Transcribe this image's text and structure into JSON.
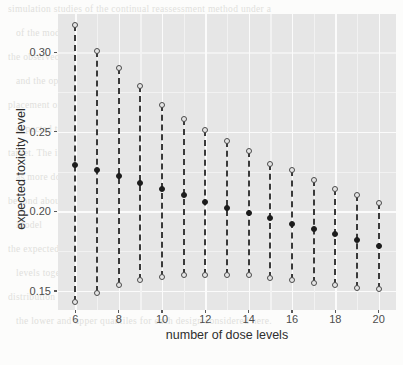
{
  "figure": {
    "background_color": "#fcfcfb",
    "panel_color": "#e6e6e6",
    "gridline_color": "#fbfbfb",
    "point_color": "#1c1c1c",
    "line_color": "#3a3a3a"
  },
  "background_text": {
    "note": "faint scanned body text visible behind the figure",
    "lines": [
      "simulation studies of the continual reassessment method under a",
      "of the model parameters is then maintained by the prior distribution.",
      "the observed data, a key feature is that the number of dose levels",
      "and the operating characteristics are not overly sensitive to the",
      "placement of the dose levels. As the number of doses increases the",
      "expected toxicity level at the recommended dose tends toward the",
      "target. The interval between the upper and lower quantiles narrows",
      "as more dose levels are included, although the gain diminishes",
      "beyond about fifteen levels in these simulations.",
      "Model",
      "the expected toxicity level is plotted against the number of dose",
      "levels together with the tenth and ninetieth percentiles of the",
      "distribution of the recommended dose. The dashed segments join",
      "the lower and upper quantiles for each design considered here."
    ]
  },
  "chart_data": {
    "type": "scatter",
    "title": "",
    "xlabel": "number of dose levels",
    "ylabel": "expected toxicity level",
    "xlim": [
      5.2,
      20.8
    ],
    "ylim": [
      0.138,
      0.324
    ],
    "xticks": [
      6,
      8,
      10,
      12,
      14,
      16,
      18,
      20
    ],
    "xtick_labels": [
      "6",
      "8",
      "10",
      "12",
      "14",
      "16",
      "18",
      "20"
    ],
    "yticks": [
      0.15,
      0.2,
      0.25,
      0.3
    ],
    "ytick_labels": [
      "0.15",
      "0.20",
      "0.25",
      "0.30"
    ],
    "grid": true,
    "legend": "none",
    "x": [
      6,
      7,
      8,
      9,
      10,
      11,
      12,
      13,
      14,
      15,
      16,
      17,
      18,
      19,
      20
    ],
    "series": [
      {
        "name": "upper quantile",
        "marker": "open-circle",
        "values": [
          0.317,
          0.301,
          0.29,
          0.279,
          0.267,
          0.258,
          0.251,
          0.244,
          0.238,
          0.23,
          0.226,
          0.22,
          0.214,
          0.21,
          0.205
        ]
      },
      {
        "name": "expected toxicity level",
        "marker": "filled-circle",
        "values": [
          0.229,
          0.226,
          0.222,
          0.218,
          0.214,
          0.21,
          0.206,
          0.202,
          0.199,
          0.196,
          0.192,
          0.189,
          0.186,
          0.182,
          0.178
        ]
      },
      {
        "name": "lower quantile",
        "marker": "open-circle",
        "values": [
          0.143,
          0.149,
          0.154,
          0.157,
          0.159,
          0.16,
          0.16,
          0.16,
          0.16,
          0.158,
          0.157,
          0.155,
          0.154,
          0.152,
          0.151
        ]
      }
    ]
  }
}
